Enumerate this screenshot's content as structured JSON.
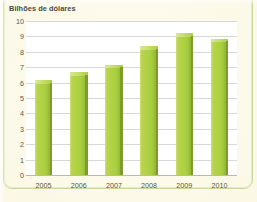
{
  "chart_data": {
    "type": "bar",
    "title": "Bilhões de dólares",
    "subtitle": "",
    "xlabel": "",
    "ylabel": "",
    "categories": [
      "2005",
      "2006",
      "2007",
      "2008",
      "2009",
      "2010"
    ],
    "values": [
      6.0,
      6.5,
      7.0,
      8.2,
      9.05,
      8.7
    ],
    "series": [
      {
        "name": "Bilhões de dólares",
        "values": [
          6.0,
          6.5,
          7.0,
          8.2,
          9.05,
          8.7
        ]
      }
    ],
    "ylim": [
      0,
      10
    ],
    "yticks": [
      0,
      1,
      2,
      3,
      4,
      5,
      6,
      7,
      8,
      9,
      10
    ],
    "ytick_labels": [
      "0",
      "1",
      "2",
      "3",
      "4",
      "5",
      "6",
      "7",
      "8",
      "9",
      "10"
    ],
    "grid": true,
    "grid_axis": "y",
    "legend": false,
    "legend_position": "none",
    "bar_color": "#aed244",
    "bar_shadow_color": "#7e9c2d",
    "bar_highlight_color": "#c7e06a",
    "plot_background": "#ffffff",
    "figure_background": "#fcf8e6",
    "grid_color": "#d8d8d4",
    "axis_color": "#b9b9b2",
    "text_color": "#55554e",
    "frame_color": "#c9d79a"
  }
}
